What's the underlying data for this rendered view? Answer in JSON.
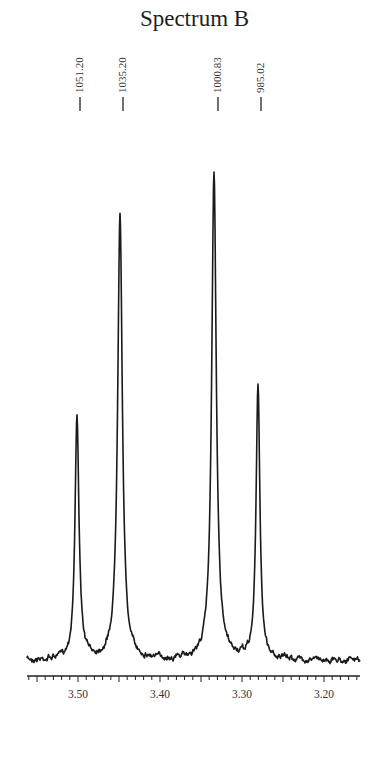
{
  "title": "Spectrum B",
  "chart_data": {
    "type": "line",
    "title": "Spectrum B",
    "xlabel": "",
    "ylabel": "",
    "x_unit": "ppm",
    "x_reversed": true,
    "xlim": [
      3.565,
      3.158
    ],
    "x_ticks": [
      3.5,
      3.4,
      3.3,
      3.2
    ],
    "x_tick_labels": [
      "3.50",
      "3.40",
      "3.30",
      "3.20"
    ],
    "minor_tick_step": 0.01,
    "grid": false,
    "legend": null,
    "peaks": [
      {
        "label": "1051.20",
        "hz": 1051.2,
        "ppm": 3.504,
        "relative_height": 0.5
      },
      {
        "label": "1035.20",
        "hz": 1035.2,
        "ppm": 3.451,
        "relative_height": 0.92
      },
      {
        "label": "1000.83",
        "hz": 1000.83,
        "ppm": 3.336,
        "relative_height": 1.0
      },
      {
        "label": "985.02",
        "hz": 985.02,
        "ppm": 3.283,
        "relative_height": 0.56
      }
    ],
    "annotations": [
      "1051.20",
      "1035.20",
      "1000.83",
      "985.02"
    ],
    "pattern": "doublet of doublets (AB-type quartet)"
  }
}
